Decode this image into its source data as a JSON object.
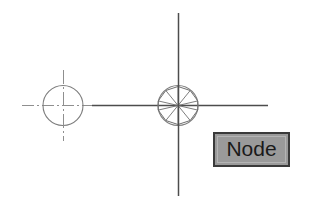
{
  "image": {
    "width": 319,
    "height": 199,
    "background_color": "#ffffff",
    "type": "cad-technical-drawing"
  },
  "drawing": {
    "title": "",
    "line_color": "#4d4d4d",
    "centerline_color": "#8c8c8c",
    "elements": [
      {
        "name": "horizontal-centerline",
        "kind": "line",
        "x1": 22,
        "y1": 105,
        "x2": 268,
        "y2": 105
      },
      {
        "name": "left-circle",
        "kind": "circle",
        "cx": 63,
        "cy": 105,
        "r": 20
      },
      {
        "name": "left-circle-vertical-centerline",
        "kind": "line",
        "x1": 63,
        "y1": 70,
        "x2": 63,
        "y2": 141
      },
      {
        "name": "node-symbol-circle",
        "kind": "circle",
        "cx": 178,
        "cy": 105,
        "r": 20
      },
      {
        "name": "node-symbol-inscribed-polygon",
        "kind": "polygon",
        "sides": 9,
        "cx": 178,
        "cy": 105,
        "r": 19
      },
      {
        "name": "node-symbol-spokes",
        "kind": "spokes",
        "count": 9,
        "cx": 178,
        "cy": 105,
        "r": 19
      },
      {
        "name": "main-vertical-centerline",
        "kind": "line",
        "x1": 178,
        "y1": 13,
        "x2": 178,
        "y2": 196
      }
    ]
  },
  "callout": {
    "label": "Node",
    "fill_color": "#9a9a9a",
    "border_color": "#3a3a3a",
    "text_color": "#1a1a1a",
    "x": 213,
    "y": 132,
    "width": 77,
    "height": 35
  }
}
